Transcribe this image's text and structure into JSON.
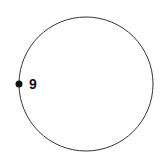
{
  "diagram": {
    "shape": "circle",
    "marker": {
      "label": "9",
      "position": "left"
    },
    "colors": {
      "stroke": "#333333",
      "marker": "#111111",
      "background": "#ffffff"
    }
  }
}
